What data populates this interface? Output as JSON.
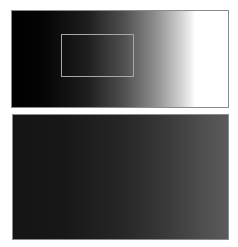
{
  "figure": {
    "panels": [
      {
        "id": "top",
        "description": "horizontal grayscale gradient, black to white",
        "gradient": {
          "direction": "left-to-right",
          "start_color": "#000000",
          "end_color": "#ffffff"
        },
        "highlight_box": {
          "border_color": "#a8a8a8"
        }
      },
      {
        "id": "bottom",
        "description": "horizontal grayscale gradient, near-black to dark gray",
        "gradient": {
          "direction": "left-to-right",
          "start_color": "#141414",
          "end_color": "#5a5a5a"
        }
      }
    ],
    "colors": {
      "background": "#ffffff",
      "panel_border": "#8a8a8a"
    }
  }
}
